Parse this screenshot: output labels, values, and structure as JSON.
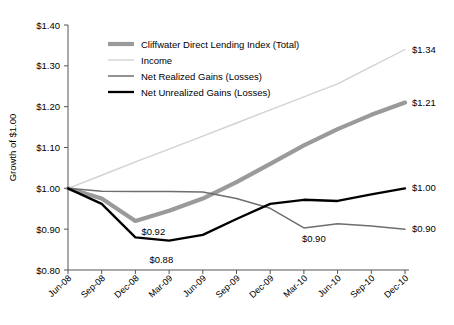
{
  "chart_data": {
    "type": "line",
    "title": "",
    "xlabel": "",
    "ylabel": "Growth of $1.00",
    "grid": false,
    "legend_position": "top-center-inside",
    "x": [
      "Jun-08",
      "Sep-08",
      "Dec-08",
      "Mar-09",
      "Jun-09",
      "Sep-09",
      "Dec-09",
      "Mar-10",
      "Jun-10",
      "Sep-10",
      "Dec-10"
    ],
    "ylim": [
      0.8,
      1.4
    ],
    "ytick_values": [
      0.8,
      0.9,
      1.0,
      1.1,
      1.2,
      1.3,
      1.4
    ],
    "ytick_labels": [
      "$0.80",
      "$0.90",
      "$1.00",
      "$1.10",
      "$1.20",
      "$1.30",
      "$1.40"
    ],
    "series": [
      {
        "name": "Cliffwater Direct Lending Index (Total)",
        "color": "#9a9a9a",
        "width": 4.2,
        "values": [
          1.0,
          0.975,
          0.92,
          0.945,
          0.975,
          1.015,
          1.06,
          1.105,
          1.145,
          1.18,
          1.21
        ]
      },
      {
        "name": "Income",
        "color": "#d2d2d2",
        "width": 1.4,
        "values": [
          1.0,
          1.032,
          1.065,
          1.096,
          1.128,
          1.16,
          1.192,
          1.224,
          1.256,
          1.298,
          1.34
        ]
      },
      {
        "name": "Net Realized Gains (Losses)",
        "color": "#6e6e6e",
        "width": 1.5,
        "values": [
          1.0,
          0.993,
          0.992,
          0.992,
          0.991,
          0.975,
          0.951,
          0.903,
          0.913,
          0.908,
          0.9
        ]
      },
      {
        "name": "Net Unrealized Gains (Losses)",
        "color": "#000000",
        "width": 2.3,
        "values": [
          1.0,
          0.962,
          0.88,
          0.872,
          0.886,
          0.925,
          0.962,
          0.972,
          0.969,
          0.985,
          1.0
        ]
      }
    ],
    "annotations": [
      {
        "text": "$0.92",
        "x_index": 2,
        "value": 0.92,
        "dx": 6,
        "dy": 14,
        "anchor": "start"
      },
      {
        "text": "$0.88",
        "x_index": 2,
        "value": 0.88,
        "dx": 14,
        "dy": 26,
        "anchor": "start"
      },
      {
        "text": "$0.90",
        "x_index": 7,
        "value": 0.903,
        "dx": -2,
        "dy": 14,
        "anchor": "start"
      },
      {
        "text": "$1.34",
        "x_index": 10,
        "value": 1.34,
        "dx": 7,
        "dy": 3,
        "anchor": "start"
      },
      {
        "text": "$1.21",
        "x_index": 10,
        "value": 1.21,
        "dx": 7,
        "dy": 3,
        "anchor": "start"
      },
      {
        "text": "$1.00",
        "x_index": 10,
        "value": 1.0,
        "dx": 7,
        "dy": 3,
        "anchor": "start"
      },
      {
        "text": "$0.90",
        "x_index": 10,
        "value": 0.9,
        "dx": 7,
        "dy": 3,
        "anchor": "start"
      }
    ]
  }
}
